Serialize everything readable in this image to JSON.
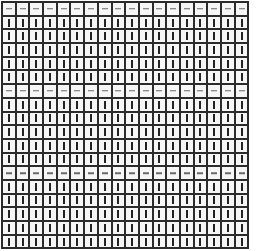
{
  "board": {
    "columns": 18,
    "rows": 18,
    "row_pattern": [
      "dash",
      "bar",
      "bar",
      "bar",
      "bar",
      "bar",
      "dash",
      "bar",
      "bar",
      "bar",
      "bar",
      "bar",
      "dash",
      "bar",
      "bar",
      "bar",
      "bar",
      "bar"
    ],
    "cell_types": {
      "dash": {
        "icon": "horizontal-dash-icon",
        "color": "#6a6a6a"
      },
      "bar": {
        "icon": "vertical-bar-icon",
        "color": "#222222"
      }
    },
    "grid_line_color": "#2b2b2b",
    "cell_background": "#f6f6f6"
  }
}
